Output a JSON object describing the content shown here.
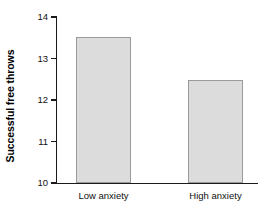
{
  "chart_data": {
    "type": "bar",
    "title": "",
    "xlabel": "",
    "ylabel": "Successful free throws",
    "categories": [
      "Low anxiety",
      "High anxiety"
    ],
    "values": [
      13.53,
      12.47
    ],
    "ylim": [
      10,
      14
    ],
    "yticks": [
      10,
      11,
      12,
      13,
      14
    ],
    "ytick_labels": [
      "10",
      "11",
      "12",
      "13",
      "14"
    ],
    "grid": false,
    "legend": null,
    "bar_fill_color": "#dcdcdc",
    "bar_border_color": "#9a9a9a",
    "axis_color": "#1a1a1a"
  }
}
